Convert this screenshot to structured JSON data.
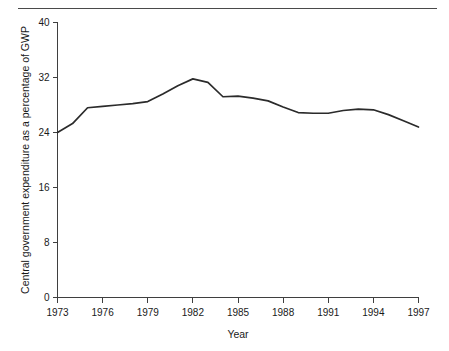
{
  "figure": {
    "has_top_rule": true,
    "background_color": "#ffffff",
    "line_color": "#2b2b2b",
    "axis_color": "#3f3f3f"
  },
  "chart_data": {
    "type": "line",
    "title": "",
    "subtitle": "",
    "xlabel": "Year",
    "ylabel": "Central government expenditure as a percentage of GWP",
    "xlim": [
      1973,
      1997
    ],
    "ylim": [
      0,
      40
    ],
    "grid": false,
    "legend": false,
    "legend_position": "none",
    "x_ticks": [
      1973,
      1976,
      1979,
      1982,
      1985,
      1988,
      1991,
      1994,
      1997
    ],
    "x_tick_labels": [
      "1973",
      "1976",
      "1979",
      "1982",
      "1985",
      "1988",
      "1991",
      "1994",
      "1997"
    ],
    "y_ticks": [
      0,
      8,
      16,
      24,
      32,
      40
    ],
    "y_tick_labels": [
      "0",
      "8",
      "16",
      "24",
      "32",
      "40"
    ],
    "x": [
      1973,
      1974,
      1975,
      1976,
      1977,
      1978,
      1979,
      1980,
      1981,
      1982,
      1983,
      1984,
      1985,
      1986,
      1987,
      1988,
      1989,
      1990,
      1991,
      1992,
      1993,
      1994,
      1995,
      1996,
      1997
    ],
    "values": [
      24.0,
      25.3,
      27.6,
      27.8,
      28.0,
      28.2,
      28.5,
      29.6,
      30.8,
      31.8,
      31.3,
      29.2,
      29.3,
      29.0,
      28.6,
      27.7,
      26.9,
      26.8,
      26.8,
      27.2,
      27.4,
      27.3,
      26.6,
      25.7,
      24.8
    ],
    "series": [
      {
        "name": "Central government expenditure as a percentage of GWP",
        "values": [
          24.0,
          25.3,
          27.6,
          27.8,
          28.0,
          28.2,
          28.5,
          29.6,
          30.8,
          31.8,
          31.3,
          29.2,
          29.3,
          29.0,
          28.6,
          27.7,
          26.9,
          26.8,
          26.8,
          27.2,
          27.4,
          27.3,
          26.6,
          25.7,
          24.8
        ]
      }
    ],
    "annotations": []
  }
}
